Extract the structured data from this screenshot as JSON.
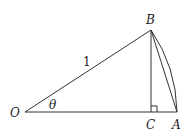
{
  "diagram": {
    "type": "geometry",
    "points": {
      "O": {
        "label": "O"
      },
      "B": {
        "label": "B"
      },
      "C": {
        "label": "C"
      },
      "A": {
        "label": "A"
      }
    },
    "labels": {
      "radius": "1",
      "angle": "θ"
    },
    "colors": {
      "stroke": "#333333",
      "text": "#222222",
      "background": "#ffffff"
    }
  }
}
